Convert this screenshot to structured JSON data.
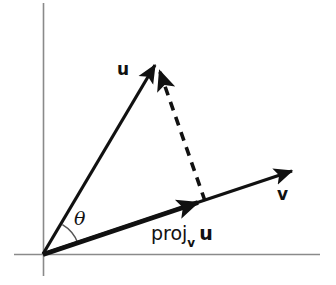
{
  "figure": {
    "kind": "vector-projection-diagram",
    "background_color": "#ffffff",
    "ink_color": "#111111",
    "axis_color": "#8a8a8a"
  },
  "axes": {
    "origin": {
      "x": 43,
      "y": 254
    },
    "x_axis": {
      "x1": 14,
      "y1": 254,
      "x2": 320,
      "y2": 254
    },
    "y_axis": {
      "x1": 43,
      "y1": 3,
      "x2": 43,
      "y2": 276
    }
  },
  "vectors": [
    {
      "name": "u",
      "label": "u",
      "from": {
        "x": 43,
        "y": 254
      },
      "to": {
        "x": 157,
        "y": 62
      },
      "style": "solid",
      "stroke_width": 3.2,
      "label_pos": {
        "x": 117,
        "y": 61
      }
    },
    {
      "name": "v",
      "label": "v",
      "from": {
        "x": 43,
        "y": 254
      },
      "to": {
        "x": 295,
        "y": 170
      },
      "style": "solid",
      "stroke_width": 3.2,
      "label_pos": {
        "x": 277,
        "y": 186
      }
    },
    {
      "name": "projection",
      "label_prefix": "proj",
      "label_subscript": "v",
      "label_suffix": "u",
      "from": {
        "x": 43,
        "y": 254
      },
      "to": {
        "x": 205,
        "y": 203
      },
      "style": "solid-heavy",
      "stroke_width": 5.0,
      "label_pos": {
        "x": 151,
        "y": 224
      }
    }
  ],
  "dashed_segment": {
    "name": "projection-drop-line",
    "from": {
      "x": 157,
      "y": 64
    },
    "to": {
      "x": 205,
      "y": 201
    },
    "dash_pattern": "9 7",
    "stroke_width": 3.6
  },
  "angle": {
    "symbol": "θ",
    "name": "theta",
    "vertex": {
      "x": 43,
      "y": 254
    },
    "radius": 36,
    "between": [
      "projection",
      "u"
    ],
    "label_pos": {
      "x": 74,
      "y": 209
    }
  },
  "labels": {
    "u": "u",
    "v": "v",
    "theta": "θ",
    "proj_prefix": "proj",
    "proj_subscript": "v",
    "proj_suffix": "u"
  }
}
